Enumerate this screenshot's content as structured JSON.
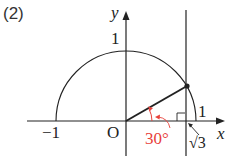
{
  "problem_label": "(2)",
  "axes": {
    "x_label": "x",
    "y_label": "y",
    "origin_label": "O"
  },
  "ticks": {
    "neg_one": "−1",
    "y_one": "1",
    "x_one": "1",
    "sqrt3": "√3"
  },
  "angle": {
    "label": "30°",
    "color": "#e8413a"
  },
  "colors": {
    "line": "#222222",
    "accent": "#e8413a"
  }
}
